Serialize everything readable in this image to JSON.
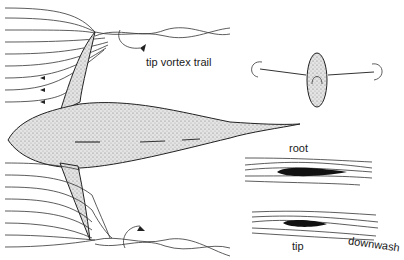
{
  "labels": {
    "tip_vortex_trail": "tip vortex trail",
    "root": "root",
    "tip": "tip",
    "downwash": "downwash"
  },
  "colors": {
    "ink": "#1a1a1a",
    "stipple": "#c9c9c9",
    "background": "#ffffff"
  }
}
